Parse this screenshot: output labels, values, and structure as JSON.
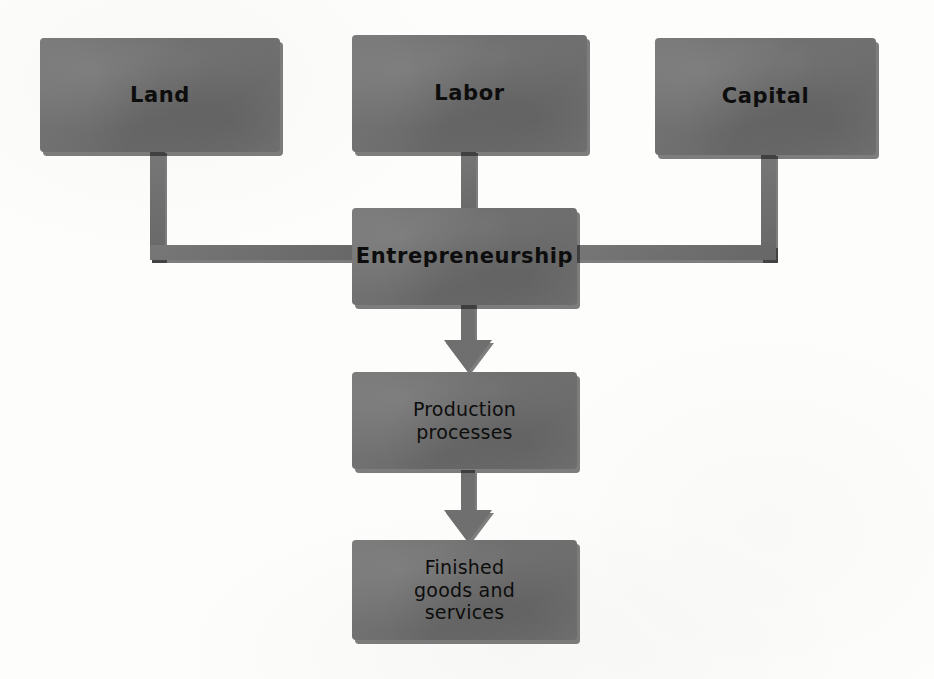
{
  "diagram": {
    "type": "flowchart",
    "title_visible": false,
    "background_color": "#fdfdfc",
    "node_fill_color": "#6f6f6f",
    "node_text_color": "#0d0d0d",
    "shadow_color": "#141414",
    "nodes": [
      {
        "id": "land",
        "label": "Land",
        "emphasis": "bold",
        "lines": [
          "Land"
        ]
      },
      {
        "id": "labor",
        "label": "Labor",
        "emphasis": "bold",
        "lines": [
          "Labor"
        ]
      },
      {
        "id": "capital",
        "label": "Capital",
        "emphasis": "bold",
        "lines": [
          "Capital"
        ]
      },
      {
        "id": "entrepreneurship",
        "label": "Entrepreneurship",
        "emphasis": "bold",
        "lines": [
          "Entrepreneurship"
        ]
      },
      {
        "id": "production",
        "label": "Production processes",
        "emphasis": "regular",
        "lines": [
          "Production",
          "processes"
        ]
      },
      {
        "id": "finished",
        "label": "Finished goods and services",
        "emphasis": "regular",
        "lines": [
          "Finished",
          "goods and",
          "services"
        ]
      }
    ],
    "edges": [
      {
        "id": "land-to-entrepreneurship",
        "from": "land",
        "to": "entrepreneurship",
        "style": "elbow-line",
        "arrowhead": false
      },
      {
        "id": "labor-to-entrepreneurship",
        "from": "labor",
        "to": "entrepreneurship",
        "style": "straight-line",
        "arrowhead": false
      },
      {
        "id": "capital-to-entrepreneurship",
        "from": "capital",
        "to": "entrepreneurship",
        "style": "elbow-line",
        "arrowhead": false
      },
      {
        "id": "entrepreneurship-to-production",
        "from": "entrepreneurship",
        "to": "production",
        "style": "block-arrow",
        "arrowhead": true
      },
      {
        "id": "production-to-finished",
        "from": "production",
        "to": "finished",
        "style": "block-arrow",
        "arrowhead": true
      }
    ]
  }
}
